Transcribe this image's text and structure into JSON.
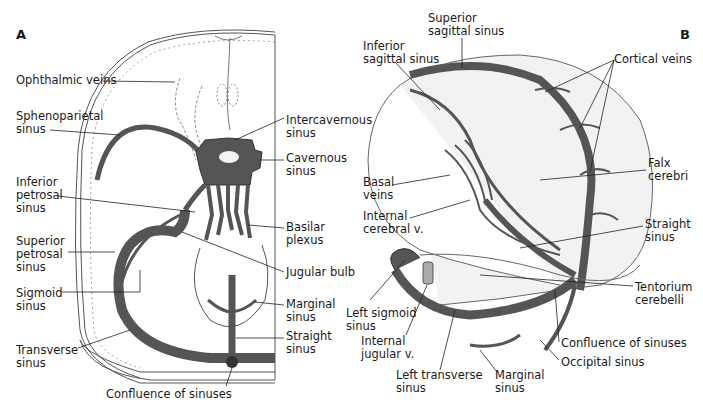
{
  "panel_a": {
    "letter": "A",
    "labels": [
      {
        "id": "ophthalmic-veins",
        "text": "Ophthalmic veins",
        "x": 16,
        "y": 74
      },
      {
        "id": "sphenoparietal-sinus",
        "text": "Sphenoparietal\nsinus",
        "x": 16,
        "y": 110
      },
      {
        "id": "intercavernous-sinus",
        "text": "Intercavernous\nsinus",
        "x": 286,
        "y": 114
      },
      {
        "id": "cavernous-sinus",
        "text": "Cavernous\nsinus",
        "x": 286,
        "y": 152
      },
      {
        "id": "inferior-petrosal-sinus",
        "text": "Inferior\npetrosal\nsinus",
        "x": 16,
        "y": 176
      },
      {
        "id": "basilar-plexus",
        "text": "Basilar\nplexus",
        "x": 286,
        "y": 221
      },
      {
        "id": "superior-petrosal-sinus",
        "text": "Superior\npetrosal\nsinus",
        "x": 16,
        "y": 235
      },
      {
        "id": "jugular-bulb",
        "text": "Jugular bulb",
        "x": 286,
        "y": 266
      },
      {
        "id": "sigmoid-sinus",
        "text": "Sigmoid\nsinus",
        "x": 16,
        "y": 287
      },
      {
        "id": "marginal-sinus",
        "text": "Marginal\nsinus",
        "x": 286,
        "y": 298
      },
      {
        "id": "straight-sinus",
        "text": "Straight\nsinus",
        "x": 286,
        "y": 330
      },
      {
        "id": "transverse-sinus",
        "text": "Transverse\nsinus",
        "x": 16,
        "y": 344
      },
      {
        "id": "confluence-of-sinuses",
        "text": "Confluence of sinuses",
        "x": 106,
        "y": 388
      }
    ]
  },
  "panel_b": {
    "letter": "B",
    "labels": [
      {
        "id": "superior-sagittal-sinus",
        "text": "Superior\nsagittal sinus",
        "x": 428,
        "y": 12
      },
      {
        "id": "inferior-sagittal-sinus",
        "text": "Inferior\nsagittal sinus",
        "x": 363,
        "y": 40
      },
      {
        "id": "cortical-veins",
        "text": "Cortical veins",
        "x": 614,
        "y": 53
      },
      {
        "id": "falx-cerebri",
        "text": "Falx\ncerebri",
        "x": 648,
        "y": 157
      },
      {
        "id": "basal-veins",
        "text": "Basal\nveins",
        "x": 363,
        "y": 176
      },
      {
        "id": "internal-cerebral-v",
        "text": "Internal\ncerebral v.",
        "x": 363,
        "y": 210
      },
      {
        "id": "straight-sinus-b",
        "text": "Straight\nsinus",
        "x": 645,
        "y": 218
      },
      {
        "id": "tentorium-cerebelli",
        "text": "Tentorium\ncerebelli",
        "x": 635,
        "y": 281
      },
      {
        "id": "left-sigmoid-sinus",
        "text": "Left sigmoid\nsinus",
        "x": 346,
        "y": 307
      },
      {
        "id": "internal-jugular-v",
        "text": "Internal\njugular v.",
        "x": 361,
        "y": 335
      },
      {
        "id": "confluence-of-sinuses-b",
        "text": "Confluence of sinuses",
        "x": 561,
        "y": 337
      },
      {
        "id": "occipital-sinus",
        "text": "Occipital sinus",
        "x": 561,
        "y": 356
      },
      {
        "id": "left-transverse-sinus",
        "text": "Left transverse\nsinus",
        "x": 396,
        "y": 369
      },
      {
        "id": "marginal-sinus-b",
        "text": "Marginal\nsinus",
        "x": 495,
        "y": 369
      }
    ]
  },
  "colors": {
    "vein": "#555555",
    "outline": "#333333",
    "leader": "#222222",
    "tissue": "#f0f0f0"
  }
}
